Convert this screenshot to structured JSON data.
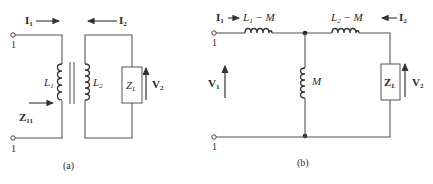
{
  "figure_a": {
    "caption": "(a)",
    "current_1": {
      "sym": "I",
      "sub": "1"
    },
    "current_2": {
      "sym": "I",
      "sub": "2"
    },
    "terminal_top": "1",
    "terminal_bottom": "1",
    "inductor_1": {
      "sym": "L",
      "sub": "1"
    },
    "inductor_2": {
      "sym": "L",
      "sub": "2"
    },
    "load": {
      "sym": "Z",
      "sub": "L"
    },
    "voltage_2": {
      "sym": "V",
      "sub": "2"
    },
    "impedance_in": {
      "sym": "Z",
      "sub": "11"
    }
  },
  "figure_b": {
    "caption": "(b)",
    "current_1": {
      "sym": "I",
      "sub": "1"
    },
    "current_2": {
      "sym": "I",
      "sub": "2"
    },
    "terminal_top": "1",
    "terminal_bottom": "1",
    "series_left": {
      "sym": "L",
      "sub": "1",
      "rest": " − M"
    },
    "series_right": {
      "sym": "L",
      "sub": "2",
      "rest": " − M"
    },
    "shunt": "M",
    "load": {
      "sym": "Z",
      "sub": "L"
    },
    "voltage_1": {
      "sym": "V",
      "sub": "1"
    },
    "voltage_2": {
      "sym": "V",
      "sub": "2"
    }
  }
}
